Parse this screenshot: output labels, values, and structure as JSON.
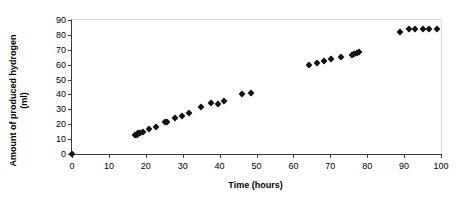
{
  "chart_data": {
    "type": "scatter",
    "title": "",
    "xlabel": "Time (hours)",
    "ylabel_line1": "Amount of produced hydrogen",
    "ylabel_line2": "(ml)",
    "xlim": [
      0,
      100
    ],
    "ylim": [
      0,
      90
    ],
    "xticks": [
      0,
      10,
      20,
      30,
      40,
      50,
      60,
      70,
      80,
      90,
      100
    ],
    "yticks": [
      0,
      10,
      20,
      30,
      40,
      50,
      60,
      70,
      80,
      90
    ],
    "grid": false,
    "legend": "none",
    "marker": "diamond",
    "marker_color": "#111111",
    "series": [
      {
        "name": "produced hydrogen",
        "points": [
          [
            0,
            0
          ],
          [
            17.0,
            12.5
          ],
          [
            17.5,
            13.0
          ],
          [
            18.0,
            13.8
          ],
          [
            18.5,
            14.3
          ],
          [
            19.2,
            15.0
          ],
          [
            20.8,
            17.0
          ],
          [
            22.8,
            17.8
          ],
          [
            25.2,
            21.2
          ],
          [
            25.8,
            21.8
          ],
          [
            27.8,
            24.5
          ],
          [
            29.8,
            25.6
          ],
          [
            31.6,
            27.5
          ],
          [
            35.0,
            31.8
          ],
          [
            37.6,
            34.0
          ],
          [
            39.5,
            33.8
          ],
          [
            41.3,
            35.8
          ],
          [
            46.0,
            40.1
          ],
          [
            48.4,
            41.3
          ],
          [
            64.2,
            59.6
          ],
          [
            66.3,
            61.0
          ],
          [
            68.2,
            62.5
          ],
          [
            70.3,
            63.6
          ],
          [
            72.8,
            65.2
          ],
          [
            75.8,
            66.5
          ],
          [
            76.5,
            67.0
          ],
          [
            77.2,
            68.0
          ],
          [
            77.8,
            68.6
          ],
          [
            88.8,
            82.2
          ],
          [
            91.3,
            84.0
          ],
          [
            93.0,
            84.0
          ],
          [
            95.0,
            84.0
          ],
          [
            96.8,
            84.0
          ],
          [
            98.8,
            84.0
          ]
        ]
      }
    ]
  }
}
